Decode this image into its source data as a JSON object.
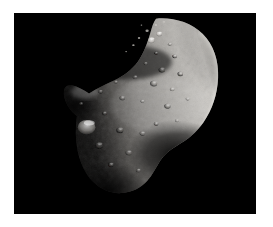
{
  "image": {
    "kind": "astronomical-photograph",
    "subject": "asteroid",
    "alt_text": "Grayscale photograph of an irregular cratered asteroid against black space",
    "caption": "",
    "background_color": "#ffffff",
    "space_color": "#000000",
    "frame": {
      "x": 14,
      "y": 13,
      "width": 242,
      "height": 201
    },
    "canvas": {
      "width": 273,
      "height": 227
    }
  },
  "scene": {
    "lighting": {
      "direction": "from-upper-right",
      "terminator_side": "left",
      "limb_side": "right",
      "highlight_color": "#e8e6e2",
      "midtone_color": "#9d9a95",
      "shadow_color": "#2a2927"
    },
    "body": {
      "name": "asteroid",
      "shape": "elongated-irregular",
      "features": [
        {
          "name": "upper-right-limb",
          "type": "bright-limb"
        },
        {
          "name": "left-promontory",
          "type": "pointed-ridge"
        },
        {
          "name": "lower-right-saddle",
          "type": "concave-notch"
        },
        {
          "name": "bright-crater-lower-left",
          "type": "crater",
          "brightness": "high"
        },
        {
          "name": "crater-field",
          "type": "crater-cluster"
        }
      ]
    },
    "craters": [
      {
        "cx": 340,
        "cy": 68,
        "r": 9,
        "tone": "bright"
      },
      {
        "cx": 360,
        "cy": 52,
        "r": 7,
        "tone": "bright"
      },
      {
        "cx": 318,
        "cy": 84,
        "r": 6,
        "tone": "mid"
      },
      {
        "cx": 386,
        "cy": 78,
        "r": 5,
        "tone": "mid"
      },
      {
        "cx": 352,
        "cy": 100,
        "r": 5,
        "tone": "dark"
      },
      {
        "cx": 300,
        "cy": 104,
        "r": 4,
        "tone": "mid"
      },
      {
        "cx": 398,
        "cy": 108,
        "r": 6,
        "tone": "dark"
      },
      {
        "cx": 326,
        "cy": 126,
        "r": 5,
        "tone": "mid"
      },
      {
        "cx": 366,
        "cy": 142,
        "r": 8,
        "tone": "dark"
      },
      {
        "cx": 412,
        "cy": 152,
        "r": 7,
        "tone": "dark"
      },
      {
        "cx": 300,
        "cy": 160,
        "r": 6,
        "tone": "mid"
      },
      {
        "cx": 346,
        "cy": 176,
        "r": 9,
        "tone": "dark"
      },
      {
        "cx": 392,
        "cy": 190,
        "r": 6,
        "tone": "mid"
      },
      {
        "cx": 252,
        "cy": 172,
        "r": 5,
        "tone": "mid"
      },
      {
        "cx": 214,
        "cy": 196,
        "r": 6,
        "tone": "dark"
      },
      {
        "cx": 268,
        "cy": 212,
        "r": 7,
        "tone": "dark"
      },
      {
        "cx": 318,
        "cy": 220,
        "r": 5,
        "tone": "mid"
      },
      {
        "cx": 380,
        "cy": 232,
        "r": 8,
        "tone": "dark"
      },
      {
        "cx": 430,
        "cy": 214,
        "r": 5,
        "tone": "mid"
      },
      {
        "cx": 224,
        "cy": 250,
        "r": 6,
        "tone": "dark"
      },
      {
        "cx": 180,
        "cy": 284,
        "r": 22,
        "tone": "bright"
      },
      {
        "cx": 262,
        "cy": 292,
        "r": 9,
        "tone": "dark"
      },
      {
        "cx": 318,
        "cy": 300,
        "r": 7,
        "tone": "mid"
      },
      {
        "cx": 210,
        "cy": 330,
        "r": 10,
        "tone": "dark"
      },
      {
        "cx": 284,
        "cy": 348,
        "r": 8,
        "tone": "mid"
      },
      {
        "cx": 352,
        "cy": 276,
        "r": 6,
        "tone": "dark"
      },
      {
        "cx": 404,
        "cy": 268,
        "r": 5,
        "tone": "mid"
      },
      {
        "cx": 240,
        "cy": 378,
        "r": 7,
        "tone": "dark"
      },
      {
        "cx": 308,
        "cy": 392,
        "r": 6,
        "tone": "mid"
      },
      {
        "cx": 166,
        "cy": 226,
        "r": 5,
        "tone": "mid"
      },
      {
        "cx": 140,
        "cy": 250,
        "r": 4,
        "tone": "dark"
      }
    ],
    "debris": [
      {
        "cx": 352,
        "cy": 30,
        "r": 3
      },
      {
        "cx": 330,
        "cy": 44,
        "r": 4
      },
      {
        "cx": 310,
        "cy": 62,
        "r": 3
      },
      {
        "cx": 296,
        "cy": 80,
        "r": 3
      },
      {
        "cx": 278,
        "cy": 96,
        "r": 2
      },
      {
        "cx": 372,
        "cy": 22,
        "r": 3
      },
      {
        "cx": 316,
        "cy": 30,
        "r": 2
      }
    ]
  }
}
